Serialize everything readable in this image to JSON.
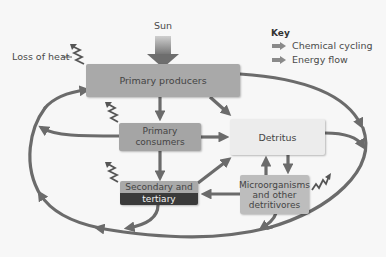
{
  "diagram": {
    "sun_label": "Sun",
    "heat_label": "Loss of heat",
    "nodes": {
      "primary_producers": "Primary producers",
      "primary_consumers": "Primary consumers",
      "detritus": "Detritus",
      "secondary_line1": "Secondary and",
      "secondary_line2": "tertiary consumers",
      "micro_line1": "Microorganisms",
      "micro_line2": "and other",
      "micro_line3": "detritivores"
    },
    "key": {
      "title": "Key",
      "items": [
        {
          "label": "Chemical cycling",
          "icon": "arrow-right-icon"
        },
        {
          "label": "Energy flow",
          "icon": "arrow-right-icon"
        }
      ]
    },
    "colors": {
      "background": "#f7f7f7",
      "arrow": "#6b6b6b",
      "box_producers": "#a9a9a9",
      "box_consumers": "#a5a5a5",
      "box_detritus": "#ececec",
      "box_micro": "#bdbdbd",
      "box_tertiary_dark": "#3a3a3a"
    }
  }
}
